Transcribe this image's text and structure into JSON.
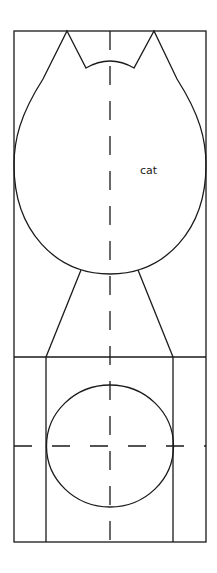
{
  "diagram": {
    "type": "sewing-pattern-template",
    "label": "cat",
    "stroke_color": "#1a1a1a",
    "background": "#ffffff",
    "parts": [
      "outer-frame",
      "cat-head-with-ears",
      "ear-notch",
      "neck-trapezoid",
      "lower-panel",
      "circle-body",
      "vertical-center-dashed-line",
      "horizontal-center-dashed-line"
    ]
  }
}
